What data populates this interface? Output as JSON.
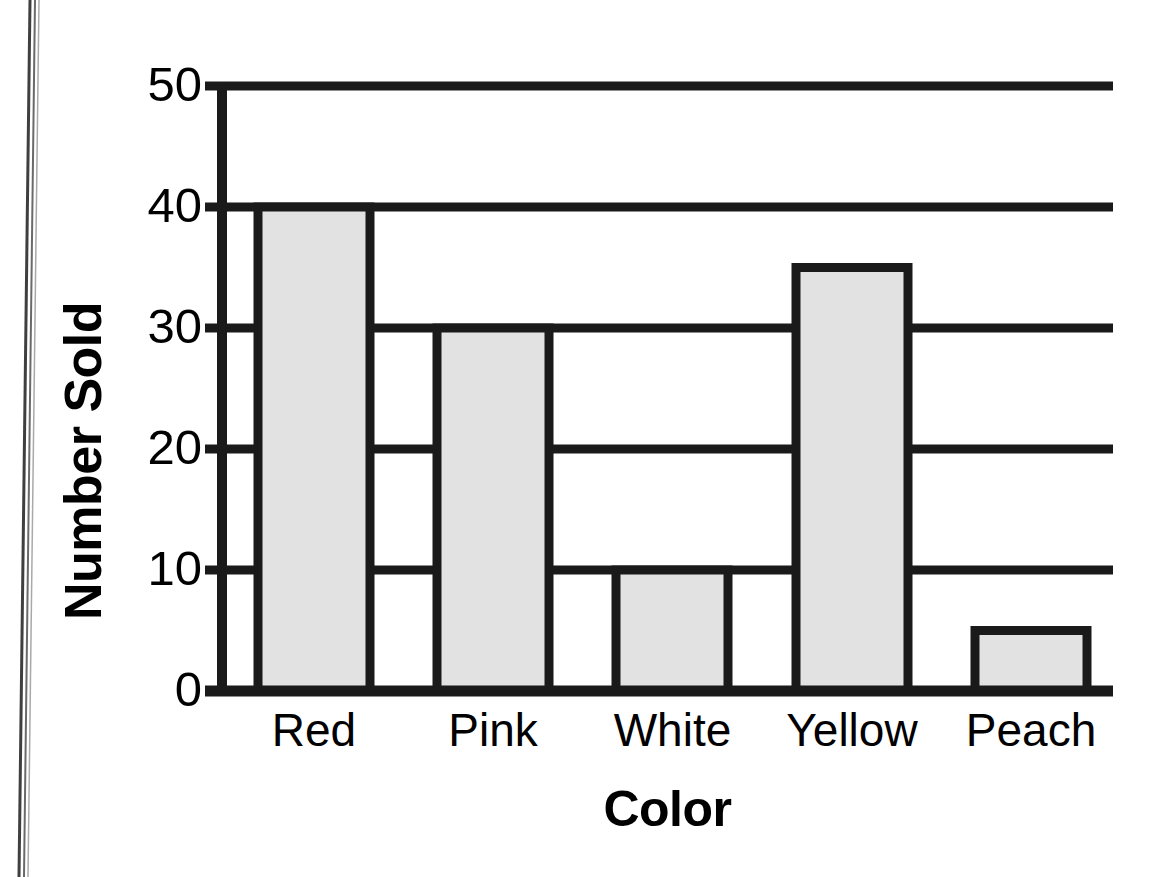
{
  "chart_data": {
    "type": "bar",
    "title": "",
    "xlabel": "Color",
    "ylabel": "Number Sold",
    "categories": [
      "Red",
      "Pink",
      "White",
      "Yellow",
      "Peach"
    ],
    "values": [
      40,
      30,
      10,
      35,
      5
    ],
    "ylim": [
      0,
      50
    ],
    "yticks": [
      0,
      10,
      20,
      30,
      40,
      50
    ],
    "ytick_labels": [
      "0",
      "10",
      "20",
      "30",
      "40",
      "50"
    ],
    "grid": "horizontal",
    "legend": "none",
    "colors": {
      "bar_fill": "#e2e2e2",
      "bar_edge": "#1a1a1a",
      "axis": "#1a1a1a",
      "gridline": "#1a1a1a",
      "background": "#ffffff",
      "text": "#000000"
    }
  },
  "axis": {
    "y_title": "Number Sold",
    "x_title": "Color",
    "y_ticks": [
      {
        "label": "50",
        "value": 50
      },
      {
        "label": "40",
        "value": 40
      },
      {
        "label": "30",
        "value": 30
      },
      {
        "label": "20",
        "value": 20
      },
      {
        "label": "10",
        "value": 10
      },
      {
        "label": "0",
        "value": 0
      }
    ],
    "x_ticks": [
      {
        "label": "Red"
      },
      {
        "label": "Pink"
      },
      {
        "label": "White"
      },
      {
        "label": "Yellow"
      },
      {
        "label": "Peach"
      }
    ]
  },
  "bars": [
    {
      "label": "Red",
      "value": 40
    },
    {
      "label": "Pink",
      "value": 30
    },
    {
      "label": "White",
      "value": 10
    },
    {
      "label": "Yellow",
      "value": 35
    },
    {
      "label": "Peach",
      "value": 5
    }
  ],
  "page": {
    "artifact": "book-binding-edge"
  }
}
